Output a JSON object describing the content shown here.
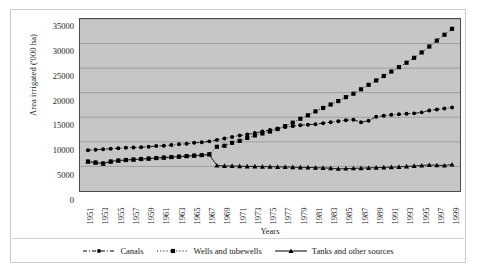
{
  "chart_data": {
    "type": "line",
    "title": "",
    "xlabel": "Years",
    "ylabel": "Area irrigated ('000 ha)",
    "ylim": [
      0,
      35000
    ],
    "ytick_values": [
      0,
      5000,
      10000,
      15000,
      20000,
      25000,
      30000,
      35000
    ],
    "ytick_labels": [
      "0",
      "5000",
      "10000",
      "15000",
      "20000",
      "25000",
      "30000",
      "35000"
    ],
    "grid": true,
    "grid_axis": "y",
    "legend_position": "bottom",
    "plot_background": "#c6c6c6",
    "x": [
      1951,
      1952,
      1953,
      1954,
      1955,
      1956,
      1957,
      1958,
      1959,
      1960,
      1961,
      1962,
      1963,
      1964,
      1965,
      1966,
      1967,
      1968,
      1969,
      1970,
      1971,
      1972,
      1973,
      1974,
      1975,
      1976,
      1977,
      1978,
      1979,
      1980,
      1981,
      1982,
      1983,
      1984,
      1985,
      1986,
      1987,
      1988,
      1989,
      1990,
      1991,
      1992,
      1993,
      1994,
      1995,
      1996,
      1997,
      1998,
      1999
    ],
    "xtick_labels": [
      "1951",
      "1953",
      "1955",
      "1957",
      "1959",
      "1961",
      "1963",
      "1965",
      "1967",
      "1969",
      "1971",
      "1973",
      "1975",
      "1977",
      "1979",
      "1981",
      "1983",
      "1985",
      "1987",
      "1989",
      "1991",
      "1993",
      "1995",
      "1997",
      "1999"
    ],
    "series": [
      {
        "name": "Canals",
        "marker": "circle",
        "line_style": "dash-dot",
        "color": "#000000",
        "values": [
          8300,
          8400,
          8500,
          8600,
          8700,
          8800,
          8850,
          8900,
          9000,
          9150,
          9200,
          9350,
          9500,
          9600,
          9800,
          9900,
          10100,
          10400,
          10700,
          11000,
          11300,
          11500,
          11800,
          12100,
          12400,
          12700,
          13000,
          13200,
          13400,
          13500,
          13600,
          13800,
          14000,
          14200,
          14400,
          14500,
          14000,
          14300,
          15100,
          15300,
          15500,
          15600,
          15700,
          15800,
          16000,
          16400,
          16600,
          16800,
          17000
        ]
      },
      {
        "name": "Wells and tubewells",
        "marker": "square",
        "line_style": "dotted",
        "color": "#000000",
        "values": [
          6000,
          5800,
          5600,
          6000,
          6200,
          6300,
          6400,
          6500,
          6600,
          6700,
          6800,
          6900,
          7000,
          7100,
          7200,
          7300,
          7500,
          9000,
          9200,
          9800,
          10200,
          10800,
          11300,
          11700,
          12100,
          12600,
          13200,
          13900,
          14700,
          15400,
          16200,
          16900,
          17600,
          18300,
          19100,
          19800,
          20700,
          21600,
          22500,
          23400,
          24300,
          25200,
          26100,
          27100,
          28200,
          29400,
          30600,
          31800,
          33000
        ]
      },
      {
        "name": "Tanks and other sources",
        "marker": "triangle",
        "line_style": "solid",
        "color": "#000000",
        "values": [
          6000,
          5800,
          5600,
          6000,
          6200,
          6300,
          6400,
          6500,
          6600,
          6700,
          6800,
          6900,
          7000,
          7100,
          7200,
          7300,
          7400,
          5200,
          5100,
          5100,
          5050,
          5000,
          5000,
          4950,
          4950,
          4900,
          4900,
          4850,
          4800,
          4800,
          4750,
          4700,
          4650,
          4500,
          4550,
          4600,
          4650,
          4700,
          4750,
          4800,
          4850,
          4900,
          5000,
          5100,
          5200,
          5300,
          5250,
          5200,
          5400
        ]
      }
    ]
  }
}
